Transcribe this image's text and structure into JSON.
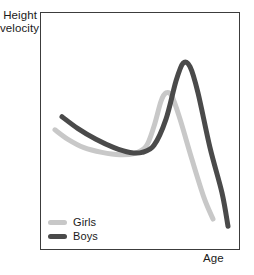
{
  "chart_data": {
    "type": "line",
    "title": "",
    "subtitle": "",
    "xlabel": "Age",
    "ylabel": "Height velocity",
    "ylabel_lines": [
      "Height",
      "velocity"
    ],
    "grid": false,
    "axis_ticks": false,
    "tick_labels": {
      "x": [],
      "y": []
    },
    "xlim": [
      0,
      100
    ],
    "ylim": [
      0,
      100
    ],
    "legend": {
      "position": "inside-bottom-left",
      "entries": [
        {
          "name": "Girls",
          "color": "#c8c8c8"
        },
        {
          "name": "Boys",
          "color": "#4a4a4a"
        }
      ]
    },
    "series": [
      {
        "name": "Girls",
        "color": "#c8c8c8",
        "linewidth": 5,
        "points": [
          {
            "x": 7.5,
            "y": 50.5
          },
          {
            "x": 14.0,
            "y": 46.5
          },
          {
            "x": 22.0,
            "y": 43.0
          },
          {
            "x": 31.0,
            "y": 41.0
          },
          {
            "x": 40.0,
            "y": 40.0
          },
          {
            "x": 47.0,
            "y": 40.5
          },
          {
            "x": 53.0,
            "y": 43.5
          },
          {
            "x": 57.0,
            "y": 52.0
          },
          {
            "x": 60.5,
            "y": 62.5
          },
          {
            "x": 63.0,
            "y": 66.0
          },
          {
            "x": 66.0,
            "y": 64.5
          },
          {
            "x": 70.0,
            "y": 55.0
          },
          {
            "x": 76.0,
            "y": 38.0
          },
          {
            "x": 82.0,
            "y": 22.0
          },
          {
            "x": 86.5,
            "y": 13.0
          }
        ]
      },
      {
        "name": "Boys",
        "color": "#4a4a4a",
        "linewidth": 5,
        "points": [
          {
            "x": 11.0,
            "y": 56.0
          },
          {
            "x": 19.0,
            "y": 51.0
          },
          {
            "x": 28.0,
            "y": 46.5
          },
          {
            "x": 37.0,
            "y": 43.0
          },
          {
            "x": 45.0,
            "y": 41.0
          },
          {
            "x": 51.0,
            "y": 41.0
          },
          {
            "x": 57.0,
            "y": 44.0
          },
          {
            "x": 63.0,
            "y": 55.0
          },
          {
            "x": 68.0,
            "y": 71.0
          },
          {
            "x": 71.5,
            "y": 78.5
          },
          {
            "x": 75.0,
            "y": 77.0
          },
          {
            "x": 79.0,
            "y": 66.0
          },
          {
            "x": 85.0,
            "y": 43.0
          },
          {
            "x": 91.0,
            "y": 24.0
          },
          {
            "x": 94.0,
            "y": 10.0
          }
        ]
      }
    ]
  },
  "figure": {
    "background_color": "#ffffff",
    "frame_color": "#3c3c3c"
  }
}
